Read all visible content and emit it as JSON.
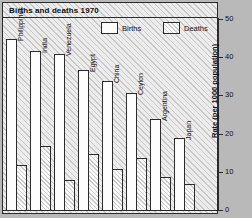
{
  "chart_data": {
    "type": "bar",
    "title": "Births and deaths 1970",
    "xlabel": "",
    "ylabel": "Rate (per 1000 population)",
    "ylim": [
      0,
      50
    ],
    "yticks": [
      0,
      10,
      20,
      30,
      40,
      50
    ],
    "grid": false,
    "legend_position": "top-right",
    "categories": [
      "Philippines",
      "India",
      "Venezuela",
      "Egypt",
      "China",
      "Ceylon",
      "Argentina",
      "Japan"
    ],
    "series": [
      {
        "name": "Births",
        "values": [
          45,
          42,
          41,
          37,
          34,
          31,
          24,
          19
        ]
      },
      {
        "name": "Deaths",
        "values": [
          12,
          17,
          8,
          15,
          11,
          14,
          9,
          7
        ]
      }
    ]
  },
  "legend": {
    "items": [
      {
        "label": "Births",
        "swatch": "births-swatch"
      },
      {
        "label": "Deaths",
        "swatch": "deaths-swatch"
      }
    ]
  },
  "yaxis": {
    "title": "Rate (per 1000 population)",
    "ticks": [
      "0",
      "10",
      "20",
      "30",
      "40",
      "50"
    ]
  }
}
